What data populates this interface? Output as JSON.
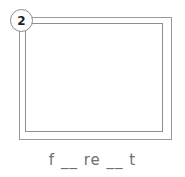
{
  "item": {
    "badge_number": "2",
    "caption": "f __ re __ t",
    "frame_colors": {
      "line": "#9a9a9a",
      "fill": "#ffffff",
      "badge_border": "#8c8c8c",
      "badge_fill": "#fdfdfd",
      "badge_text": "#1d1d1d",
      "caption_text": "#6f6f6f"
    }
  }
}
